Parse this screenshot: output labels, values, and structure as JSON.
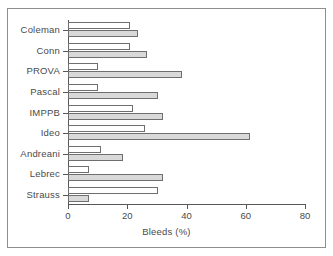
{
  "chart_data": {
    "type": "bar",
    "orientation": "horizontal",
    "title": "",
    "xlabel": "Bleeds (%)",
    "ylabel": "",
    "xlim": [
      0,
      80
    ],
    "xticks": [
      0,
      20,
      40,
      60,
      80
    ],
    "grid": false,
    "legend": null,
    "categories": [
      "Coleman",
      "Conn",
      "PROVA",
      "Pascal",
      "IMPPB",
      "Ideo",
      "Andreani",
      "Lebrec",
      "Strauss"
    ],
    "series": [
      {
        "name": "open",
        "style": "white-fill",
        "color": "#ffffff",
        "values": [
          21.0,
          21.0,
          10.0,
          10.0,
          22.0,
          26.0,
          11.0,
          7.0,
          30.5
        ]
      },
      {
        "name": "filled",
        "style": "gray-fill",
        "color": "#d9d9d9",
        "values": [
          23.5,
          26.5,
          38.5,
          30.5,
          32.0,
          61.5,
          18.5,
          32.0,
          7.0
        ]
      }
    ]
  },
  "axis": {
    "x_title": "Bleeds (%)",
    "tick_labels": [
      "0",
      "20",
      "40",
      "60",
      "80"
    ]
  },
  "categories": {
    "c0": "Coleman",
    "c1": "Conn",
    "c2": "PROVA",
    "c3": "Pascal",
    "c4": "IMPPB",
    "c5": "Ideo",
    "c6": "Andreani",
    "c7": "Lebrec",
    "c8": "Strauss"
  }
}
